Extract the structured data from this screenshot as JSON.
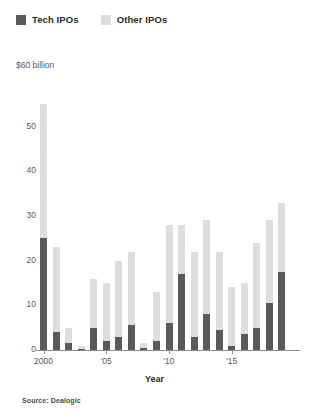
{
  "legend": {
    "position": "top-left",
    "items": [
      {
        "label": "Tech IPOs",
        "color": "#5a5a5a",
        "swatch_icon": "square-swatch-icon"
      },
      {
        "label": "Other IPOs",
        "color": "#dedede",
        "swatch_icon": "square-swatch-icon"
      }
    ]
  },
  "axes": {
    "y_unit_label": "$60 billion",
    "x_title": "Year"
  },
  "source": "Source: Dealogic",
  "chart_data": {
    "type": "bar",
    "stacked": true,
    "title": "",
    "subtitle": "",
    "xlabel": "Year",
    "ylabel": "$60 billion",
    "ylim": [
      0,
      60
    ],
    "yticks": [
      0,
      10,
      20,
      30,
      40,
      50
    ],
    "ytick_labels": [
      "0",
      "10",
      "20",
      "30",
      "40",
      "50"
    ],
    "y_axis_unit_caption": "$60 billion",
    "grid": false,
    "legend_position": "top-left",
    "categories": [
      "2000",
      "2001",
      "2002",
      "2003",
      "2004",
      "2005",
      "2006",
      "2007",
      "2008",
      "2009",
      "2010",
      "2011",
      "2012",
      "2013",
      "2014",
      "2015",
      "2016",
      "2017",
      "2018",
      "2019"
    ],
    "xtick_labels": [
      "2000",
      "'05",
      "'10",
      "'15"
    ],
    "xtick_categories": [
      "2000",
      "2005",
      "2010",
      "2015"
    ],
    "series": [
      {
        "name": "Tech IPOs",
        "color": "#5a5a5a",
        "values": [
          25,
          4,
          1.5,
          0.3,
          5,
          2,
          3,
          5.5,
          0.5,
          2,
          6,
          17,
          3,
          8,
          4.5,
          0.8,
          3.5,
          5,
          10.5,
          17.5
        ]
      },
      {
        "name": "Other IPOs",
        "color": "#dedede",
        "values": [
          30,
          19,
          3.5,
          0.7,
          11,
          13,
          17,
          16.5,
          1,
          11,
          22,
          11,
          19,
          21,
          17.5,
          13.2,
          11.5,
          19,
          18.5,
          15.5
        ]
      }
    ],
    "totals": [
      55,
      23,
      5,
      1,
      16,
      15,
      20,
      22,
      1.5,
      13,
      28,
      28,
      22,
      29,
      22,
      14,
      15,
      24,
      29,
      33
    ],
    "annotations": [
      "Source: Dealogic"
    ]
  }
}
